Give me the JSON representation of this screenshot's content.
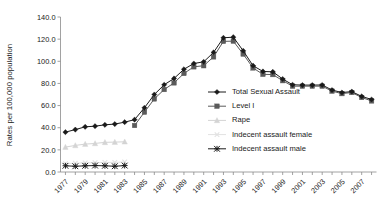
{
  "chart_data": {
    "type": "line",
    "title": "",
    "xlabel": "",
    "ylabel": "Rates per 100,000 population",
    "xlim": [
      1976.5,
      2008.5
    ],
    "ylim": [
      0,
      140
    ],
    "ytick_values": [
      0,
      20,
      40,
      60,
      80,
      100,
      120,
      140
    ],
    "ytick_labels": [
      "0.0",
      "20.0",
      "40.0",
      "60.0",
      "80.0",
      "100.0",
      "120.0",
      "140.0"
    ],
    "xtick_values": [
      1977,
      1979,
      1981,
      1983,
      1985,
      1987,
      1989,
      1991,
      1993,
      1995,
      1997,
      1999,
      2001,
      2003,
      2005,
      2007
    ],
    "xtick_labels": [
      "1977",
      "1979",
      "1981",
      "1983",
      "1985",
      "1987",
      "1989",
      "1991",
      "1993",
      "1995",
      "1997",
      "1999",
      "2001",
      "2003",
      "2005",
      "2007"
    ],
    "grid": false,
    "legend_position": "center-right",
    "x": [
      1977,
      1978,
      1979,
      1980,
      1981,
      1982,
      1983,
      1984,
      1985,
      1986,
      1987,
      1988,
      1989,
      1990,
      1991,
      1992,
      1993,
      1994,
      1995,
      1996,
      1997,
      1998,
      1999,
      2000,
      2001,
      2002,
      2003,
      2004,
      2005,
      2006,
      2007,
      2008
    ],
    "series": [
      {
        "name": "Total Sexual Assault",
        "color": "#1a1a1a",
        "marker": "diamond",
        "values": [
          36.0,
          38.3,
          40.8,
          41.4,
          42.6,
          43.3,
          45.0,
          47.3,
          58.0,
          70.0,
          78.8,
          84.5,
          92.8,
          98.0,
          99.5,
          108.0,
          121.2,
          121.8,
          109.5,
          96.0,
          90.8,
          90.5,
          84.0,
          78.8,
          78.5,
          78.5,
          78.6,
          74.0,
          71.8,
          72.6,
          68.3,
          65.5
        ]
      },
      {
        "name": "Level I",
        "color": "#5a5a5a",
        "marker": "square",
        "values": [
          null,
          null,
          null,
          null,
          null,
          null,
          null,
          42.0,
          54.0,
          66.0,
          74.5,
          80.5,
          89.0,
          95.0,
          96.0,
          104.0,
          118.0,
          118.2,
          106.5,
          94.0,
          88.2,
          88.0,
          82.5,
          77.5,
          77.5,
          77.5,
          77.5,
          73.0,
          70.8,
          71.8,
          67.3,
          64.2
        ]
      },
      {
        "name": "Rape",
        "color": "#d4d4d4",
        "marker": "triangle",
        "values": [
          22.5,
          24.0,
          25.2,
          25.8,
          26.8,
          27.0,
          27.3,
          null,
          null,
          null,
          null,
          null,
          null,
          null,
          null,
          null,
          null,
          null,
          null,
          null,
          null,
          null,
          null,
          null,
          null,
          null,
          null,
          null,
          null,
          null,
          null,
          null
        ]
      },
      {
        "name": "Indecent assault female",
        "color": "#e2e2e2",
        "marker": "cross",
        "values": [
          7.5,
          8.0,
          8.2,
          8.4,
          8.6,
          8.7,
          9.0,
          null,
          null,
          null,
          null,
          null,
          null,
          null,
          null,
          null,
          null,
          null,
          null,
          null,
          null,
          null,
          null,
          null,
          null,
          null,
          null,
          null,
          null,
          null,
          null,
          null
        ]
      },
      {
        "name": "Indecent assault male",
        "color": "#1a1a1a",
        "marker": "asterisk",
        "values": [
          5.6,
          5.2,
          5.6,
          5.8,
          5.6,
          5.2,
          5.8,
          null,
          null,
          null,
          null,
          null,
          null,
          null,
          null,
          null,
          null,
          null,
          null,
          null,
          null,
          null,
          null,
          null,
          null,
          null,
          null,
          null,
          null,
          null,
          null,
          null
        ]
      }
    ]
  },
  "legend": {
    "items": [
      {
        "label": "Total Sexual Assault",
        "marker": "diamond-marker",
        "color": "#1a1a1a"
      },
      {
        "label": "Level I",
        "marker": "square-marker",
        "color": "#5a5a5a"
      },
      {
        "label": "Rape",
        "marker": "triangle-marker",
        "color": "#d4d4d4"
      },
      {
        "label": "Indecent assault female",
        "marker": "cross-marker",
        "color": "#e2e2e2"
      },
      {
        "label": "Indecent assault male",
        "marker": "asterisk-marker",
        "color": "#1a1a1a"
      }
    ]
  }
}
